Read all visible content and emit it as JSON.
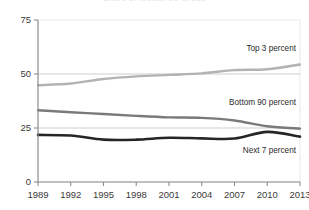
{
  "title": {
    "text": "Share of Wealth by Group",
    "visible_cut_off": true
  },
  "axes": {
    "y_ticks": [
      "0",
      "25",
      "50",
      "75"
    ],
    "y_values": [
      0,
      25,
      50,
      75
    ],
    "x_ticks": [
      "1989",
      "1992",
      "1995",
      "1998",
      "2001",
      "2004",
      "2007",
      "2010",
      "2013"
    ],
    "gridlines_at": [
      25,
      50
    ]
  },
  "labels": {
    "top3": "Top 3 percent",
    "bottom90": "Bottom 90 percent",
    "next7": "Next 7 percent"
  },
  "colors": {
    "top3": "#b3b3b3",
    "bottom90": "#7a7a7a",
    "next7": "#262626",
    "axis": "#8c8c8c",
    "grid": "#b9b9b9",
    "text": "#3a3a3a",
    "background": "#ffffff"
  },
  "chart_data": {
    "type": "line",
    "title": "Share of Wealth by Group",
    "xlabel": "",
    "ylabel": "",
    "xlim": [
      1989,
      2013
    ],
    "ylim": [
      0,
      75
    ],
    "grid": true,
    "legend_position": "inline-annotations",
    "x": [
      1989,
      1992,
      1995,
      1998,
      2001,
      2004,
      2007,
      2010,
      2013
    ],
    "series": [
      {
        "name": "Top 3 percent",
        "color": "#b3b3b3",
        "values": [
          44.8,
          45.6,
          47.7,
          48.9,
          49.6,
          50.3,
          51.8,
          52.2,
          54.4
        ]
      },
      {
        "name": "Bottom 90 percent",
        "color": "#7a7a7a",
        "values": [
          33.2,
          32.3,
          31.5,
          30.6,
          29.9,
          29.7,
          28.5,
          25.8,
          24.7
        ]
      },
      {
        "name": "Next 7 percent",
        "color": "#262626",
        "values": [
          21.8,
          21.5,
          19.6,
          19.6,
          20.5,
          20.2,
          20.1,
          23.2,
          21.0
        ]
      }
    ],
    "annotations": [
      {
        "text": "Top 3 percent",
        "x": 2010,
        "y": 58
      },
      {
        "text": "Bottom 90 percent",
        "x": 2009,
        "y": 33
      },
      {
        "text": "Next 7 percent",
        "x": 2010,
        "y": 14
      }
    ]
  }
}
